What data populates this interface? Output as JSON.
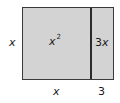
{
  "diagram": {
    "colors": {
      "fill": "#d3d3d3",
      "border": "#3a3a3a",
      "text": "#1a1a1a"
    },
    "side_labels": {
      "left": "x",
      "bottom_left": "x",
      "bottom_right": "3"
    },
    "regions": [
      {
        "name": "x-squared",
        "base": "x",
        "exponent": "2"
      },
      {
        "name": "three-x",
        "coefficient": "3",
        "variable": "x"
      }
    ]
  }
}
